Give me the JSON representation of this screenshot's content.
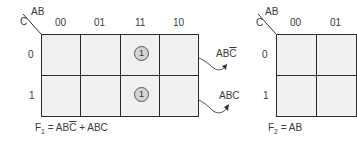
{
  "kmap1": {
    "var_row": "C",
    "var_col": "AB",
    "col_headers": [
      "00",
      "01",
      "11",
      "10"
    ],
    "row_headers": [
      "0",
      "1"
    ],
    "cells": [
      [
        "",
        "",
        "1",
        ""
      ],
      [
        "",
        "",
        "1",
        ""
      ]
    ],
    "annotations": [
      {
        "base": "AB",
        "over": "C",
        "text": "ABC̄"
      },
      {
        "base": "ABC",
        "over": "",
        "text": "ABC"
      }
    ],
    "equation_lhs": "F",
    "equation_sub": "1",
    "equation_rhs_1": " = AB",
    "equation_rhs_1_over": "C",
    "equation_rhs_2": " + ABC"
  },
  "kmap2": {
    "var_row": "C",
    "var_col": "AB",
    "col_headers": [
      "00",
      "01"
    ],
    "row_headers": [
      "0",
      "1"
    ],
    "equation_lhs": "F",
    "equation_sub": "2",
    "equation_rhs": " = AB"
  },
  "colors": {
    "cell_fill": "#f1f1f1",
    "grid_line": "#2b2b2b",
    "marker_fill": "#d4d4d4"
  }
}
